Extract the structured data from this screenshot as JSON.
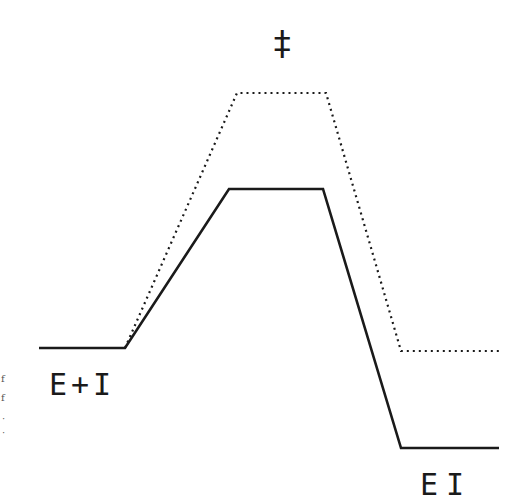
{
  "diagram": {
    "type": "reaction-energy-profile",
    "labels": {
      "transition_state": "‡",
      "reactants": "E+I",
      "product": "EI"
    },
    "margin_fragments": [
      "f",
      "f",
      "·",
      "·"
    ],
    "paths": {
      "solid": {
        "style": "solid",
        "color": "#1a1a1a",
        "points": [
          [
            39,
            348
          ],
          [
            125,
            348
          ],
          [
            229,
            189
          ],
          [
            323,
            189
          ],
          [
            401,
            448
          ],
          [
            499,
            448
          ]
        ]
      },
      "dotted": {
        "style": "dotted",
        "color": "#1a1a1a",
        "points": [
          [
            125,
            348
          ],
          [
            237,
            93
          ],
          [
            326,
            93
          ],
          [
            401,
            351
          ],
          [
            501,
            351
          ]
        ]
      }
    }
  }
}
